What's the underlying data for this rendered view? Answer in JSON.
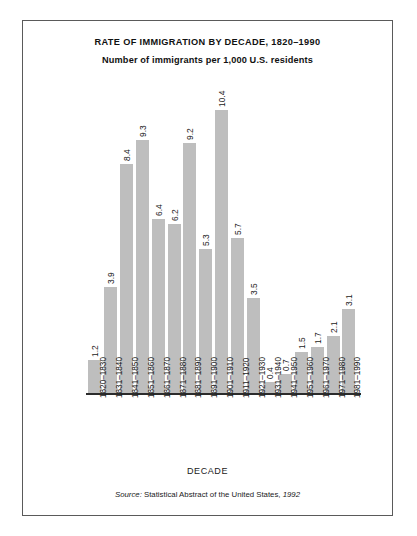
{
  "figure": {
    "background_color": "#ffffff",
    "frame_color": "#5a5a5a",
    "bar_color": "#bebebe",
    "axis_color": "#2b2b2b",
    "text_color": "#1a1a1a"
  },
  "source_note": {
    "prefix": "Source:",
    "body": "Statistical Abstract of the United States,",
    "year": "1992"
  },
  "chart_data": {
    "type": "bar",
    "title": "RATE OF IMMIGRATION BY DECADE, 1820–1990",
    "subtitle": "Number of immigrants per 1,000 U.S. residents",
    "xlabel": "DECADE",
    "ylabel": "",
    "grid": false,
    "legend": "none",
    "ylim": [
      0,
      10.4
    ],
    "orientation": "vertical",
    "value_label_rotation": 90,
    "tick_label_rotation": 90,
    "categories": [
      "1820–1830",
      "1831–1840",
      "1841–1850",
      "1851–1860",
      "1861–1870",
      "1871–1880",
      "1881–1890",
      "1891–1900",
      "1901–1910",
      "1911–1920",
      "1921–1930",
      "1931–1940",
      "1941–1950",
      "1951–1960",
      "1961–1970",
      "1971–1980",
      "1981–1990"
    ],
    "values": [
      1.2,
      3.9,
      8.4,
      9.3,
      6.4,
      6.2,
      9.2,
      5.3,
      10.4,
      5.7,
      3.5,
      0.4,
      0.7,
      1.5,
      1.7,
      2.1,
      3.1
    ],
    "value_labels": [
      "1.2",
      "3.9",
      "8.4",
      "9.3",
      "6.4",
      "6.2",
      "9.2",
      "5.3",
      "10.4",
      "5.7",
      "3.5",
      "0.4",
      "0.7",
      "1.5",
      "1.7",
      "2.1",
      "3.1"
    ]
  }
}
